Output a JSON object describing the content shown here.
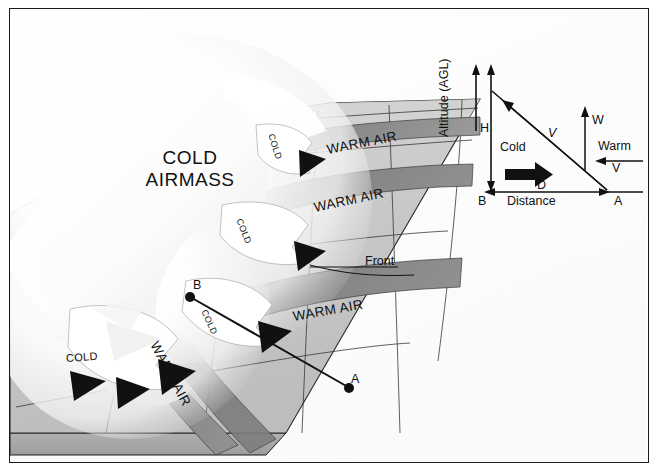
{
  "figure": {
    "type": "meteorological-schematic"
  },
  "main_diagram": {
    "name": "perspective-terrain-block",
    "cold_airmass_label": "COLD\nAIRMASS",
    "cold_airmass_line1": "COLD",
    "cold_airmass_line2": "AIRMASS",
    "front_label": "Front",
    "point_b_label": "B",
    "point_a_label": "A",
    "warm_air_label": "WARM AIR",
    "cold_tag_label": "COLD",
    "warm_bands": [
      {
        "id": "warm-band-1",
        "label": "WARM AIR"
      },
      {
        "id": "warm-band-2",
        "label": "WARM AIR"
      },
      {
        "id": "warm-band-3",
        "label": "WARM AIR"
      },
      {
        "id": "warm-band-4",
        "label": "WARM AIR"
      }
    ],
    "cold_tags": [
      {
        "id": "cold-tag-1",
        "label": "COLD"
      },
      {
        "id": "cold-tag-2",
        "label": "COLD"
      },
      {
        "id": "cold-tag-3",
        "label": "COLD"
      },
      {
        "id": "cold-tag-4",
        "label": "COLD"
      }
    ],
    "colors": {
      "terrain": "#c9c9c9",
      "terrain_shadow": "#b4b4b4",
      "warm_band": "#828282",
      "warm_band_dark": "#6e6e6e",
      "cold_air": "#ffffff",
      "outline": "#1a1a1a",
      "frame": "#1a1a1a"
    }
  },
  "inset_diagram": {
    "name": "frontal-slope-cross-section",
    "y_axis_label": "Altitude (AGL)",
    "x_axis_label": "Distance",
    "height_symbol": "H",
    "distance_symbol": "D",
    "point_b": "B",
    "point_a": "A",
    "cold_label": "Cold",
    "warm_label": "Warm",
    "slope_velocity_symbol": "V",
    "vertical_velocity_symbol": "W",
    "warm_velocity_symbol": "V"
  }
}
